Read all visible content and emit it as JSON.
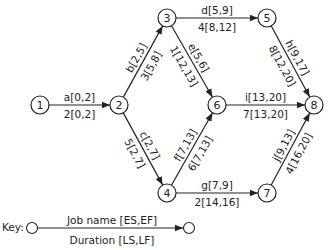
{
  "diagram": {
    "type": "activity-on-arrow network",
    "nodes": [
      {
        "id": "1",
        "x": 40,
        "y": 105
      },
      {
        "id": "2",
        "x": 119,
        "y": 105
      },
      {
        "id": "3",
        "x": 167,
        "y": 18
      },
      {
        "id": "4",
        "x": 167,
        "y": 193
      },
      {
        "id": "5",
        "x": 267,
        "y": 18
      },
      {
        "id": "6",
        "x": 217,
        "y": 105
      },
      {
        "id": "7",
        "x": 267,
        "y": 193
      },
      {
        "id": "8",
        "x": 314,
        "y": 105
      }
    ],
    "edges": [
      {
        "from": "1",
        "to": "2",
        "top": "a[0,2]",
        "bottom": "2[0,2]"
      },
      {
        "from": "2",
        "to": "3",
        "top": "b[2,5]",
        "bottom": "3[5,8]"
      },
      {
        "from": "2",
        "to": "4",
        "top": "c[2,7]",
        "bottom": "5[2,7]"
      },
      {
        "from": "3",
        "to": "5",
        "top": "d[5,9]",
        "bottom": "4[8,12]"
      },
      {
        "from": "3",
        "to": "6",
        "top": "e[5,6]",
        "bottom": "1[12,13]"
      },
      {
        "from": "4",
        "to": "6",
        "top": "f[7,13]",
        "bottom": "6[7,13]"
      },
      {
        "from": "4",
        "to": "7",
        "top": "g[7,9]",
        "bottom": "2[14,16]"
      },
      {
        "from": "5",
        "to": "8",
        "top": "h[9,17]",
        "bottom": "8[12,20]"
      },
      {
        "from": "6",
        "to": "8",
        "top": "i[13,20]",
        "bottom": "7[13,20]"
      },
      {
        "from": "7",
        "to": "8",
        "top": "j[9,13]",
        "bottom": "4[16,20]"
      }
    ],
    "key": {
      "label": "Key:",
      "top": "Job name [ES,EF]",
      "bottom": "Duration [LS,LF]"
    }
  }
}
